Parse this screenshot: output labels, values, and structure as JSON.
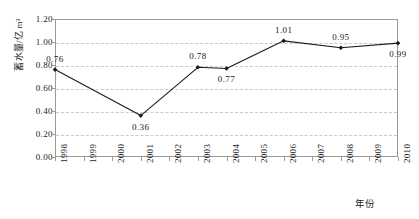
{
  "chart_data": {
    "type": "line",
    "title": "",
    "xlabel": "年份",
    "ylabel": "蓄水量/亿 m³",
    "x": [
      1998,
      1999,
      2000,
      2001,
      2002,
      2003,
      2004,
      2005,
      2006,
      2007,
      2008,
      2009,
      2010
    ],
    "xtick_labels": [
      "1998",
      "1999",
      "2000",
      "2001",
      "2002",
      "2003",
      "2004",
      "2005",
      "2006",
      "2007",
      "2008",
      "2009",
      "2010"
    ],
    "ytick_labels": [
      "0.00",
      "0.20",
      "0.40",
      "0.60",
      "0.80",
      "1.00",
      "1.20"
    ],
    "ytick_values": [
      0.0,
      0.2,
      0.4,
      0.6,
      0.8,
      1.0,
      1.2
    ],
    "xlim": [
      1998,
      2010
    ],
    "ylim": [
      0.0,
      1.2
    ],
    "grid": "horizontal-dashed",
    "legend": "none",
    "series": [
      {
        "name": "蓄水量",
        "marker": "diamond",
        "color": "#1a1a1a",
        "points": [
          {
            "x": 1998,
            "y": 0.76,
            "label": "0.76",
            "label_position": "above"
          },
          {
            "x": 2001,
            "y": 0.36,
            "label": "0.36",
            "label_position": "below"
          },
          {
            "x": 2003,
            "y": 0.78,
            "label": "0.78",
            "label_position": "above"
          },
          {
            "x": 2004,
            "y": 0.77,
            "label": "0.77",
            "label_position": "below"
          },
          {
            "x": 2006,
            "y": 1.01,
            "label": "1.01",
            "label_position": "above"
          },
          {
            "x": 2008,
            "y": 0.95,
            "label": "0.95",
            "label_position": "above"
          },
          {
            "x": 2010,
            "y": 0.99,
            "label": "0.99",
            "label_position": "below"
          }
        ]
      }
    ],
    "colors": {
      "line": "#1a1a1a",
      "marker": "#1a1a1a",
      "grid": "#c9c9c9",
      "axis": "#9a9a9a",
      "text": "#1a1a1a",
      "background": "#ffffff"
    }
  }
}
